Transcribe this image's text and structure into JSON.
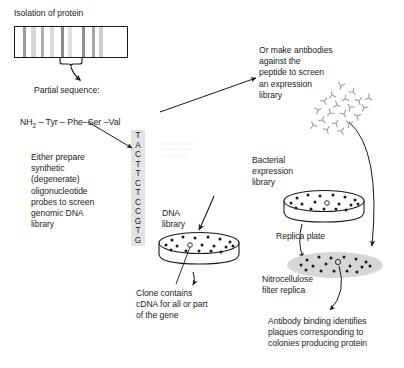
{
  "diagram": {
    "background_color": "#ffffff",
    "text_color": "#1d1d1d"
  },
  "labels": {
    "isolation_of_protein": "Isolation of protein",
    "partial_sequence_header": "Partial sequence:",
    "peptide_sequence": "NH2 – Tyr – Phe – Ser – Val",
    "peptide_tokens": [
      "NH",
      "2",
      "Tyr",
      "Phe",
      "Ser",
      "Val"
    ],
    "left_branch": "Either prepare\nsynthetic\n(degenerate)\noligonucleotide\nprobes to screen\ngenomic DNA\nlibrary",
    "right_branch": "Or make antibodies\nagainst the\npeptide to screen\nan expression\nlibrary",
    "dna_library": "DNA\nlibrary",
    "clone_contains": "Clone contains\ncDNA for all or part\nof the gene",
    "bacterial_expression_library": "Bacterial\nexpression\nlibrary",
    "replica_plate": "Replica plate",
    "nitrocellulose_filter_replica": "Nitrocellulose\nfilter replica",
    "antibody_binding": "Antibody binding identifies\nplaques corresponding to\ncolonies producing protein"
  },
  "dna_sequence": {
    "letters": [
      "T",
      "A",
      "C",
      "T",
      "T",
      "C",
      "T",
      "C",
      "C",
      "G",
      "T",
      "G"
    ],
    "strip_color": "#e3e3e3"
  },
  "gel": {
    "name": "protein-gel",
    "border_color": "#1a1a1a",
    "background": "#ffffff",
    "bands": [
      {
        "left_pct": 7,
        "width_pct": 2.6,
        "color": "#9a9a9a"
      },
      {
        "left_pct": 14,
        "width_pct": 4.5,
        "color": "#d9d9d9"
      },
      {
        "left_pct": 23,
        "width_pct": 3.0,
        "color": "#b0b0b0"
      },
      {
        "left_pct": 31,
        "width_pct": 4.0,
        "color": "#dcdcdc"
      },
      {
        "left_pct": 41,
        "width_pct": 2.4,
        "color": "#8c8c8c"
      },
      {
        "left_pct": 47,
        "width_pct": 4.2,
        "color": "#e0e0e0"
      },
      {
        "left_pct": 60,
        "width_pct": 2.6,
        "color": "#8f8f8f"
      },
      {
        "left_pct": 69,
        "width_pct": 2.4,
        "color": "#a8a8a8"
      },
      {
        "left_pct": 75,
        "width_pct": 3.2,
        "color": "#cfcfcf"
      }
    ]
  },
  "dishes": {
    "dna_library_dish": {
      "name": "dna-library-petri-dish",
      "colonies": 17,
      "fill": "#ffffff",
      "stroke": "#1a1a1a"
    },
    "bacterial_dish": {
      "name": "bacterial-expression-petri-dish",
      "colonies": 18,
      "fill": "#ffffff",
      "stroke": "#1a1a1a"
    },
    "filter_replica": {
      "name": "nitrocellulose-filter-replica",
      "colonies": 18,
      "fill": "#d6d6d6",
      "stroke": "none"
    }
  },
  "antibody_cluster": {
    "name": "antibody-molecule-cluster",
    "count": 20,
    "color": "#9b9b9b"
  },
  "arrows": {
    "gel_to_sequence": "arrow from gel brace to partial sequence",
    "sequence_to_left": "arrow to oligonucleotide probe branch",
    "sequence_to_right": "arrow to antibody branch",
    "antibody_to_filter": "arrow from antibodies to nitrocellulose filter",
    "left_to_dna_strip": "arrow to DNA probe strip",
    "strip_to_dna_library": "arrow to DNA library dish",
    "dish_to_clone": "arrow from colony to clone description",
    "replica_to_filter": "arrow from bacterial dish to filter replica",
    "filter_to_result": "arrow from filter to antibody binding result"
  }
}
